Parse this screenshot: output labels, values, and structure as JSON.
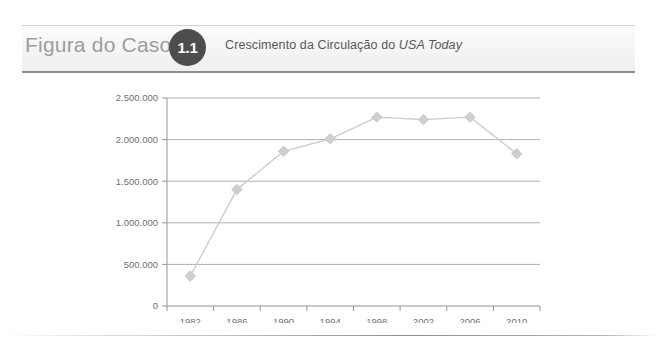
{
  "header": {
    "figure_label": "Figura do Caso",
    "figure_number": "1.1",
    "caption_prefix": "Crescimento da Circulação do ",
    "caption_emphasis": "USA Today",
    "badge_color": "#4d4d4d",
    "label_color": "#9d9d9d",
    "caption_color": "#55595c"
  },
  "chart_data": {
    "type": "line",
    "title": "Crescimento da Circulação do USA Today",
    "xlabel": "",
    "ylabel": "",
    "categories": [
      "1982",
      "1986",
      "1990",
      "1994",
      "1998",
      "2002",
      "2006",
      "2010"
    ],
    "values": [
      360000,
      1400000,
      1860000,
      2010000,
      2270000,
      2240000,
      2270000,
      1830000
    ],
    "series": [
      {
        "name": "Circulação",
        "values": [
          360000,
          1400000,
          1860000,
          2010000,
          2270000,
          2240000,
          2270000,
          1830000
        ]
      }
    ],
    "ylim": [
      0,
      2500000
    ],
    "ytick_values": [
      0,
      500000,
      1000000,
      1500000,
      2000000,
      2500000
    ],
    "ytick_labels": [
      "0",
      "500.000",
      "1.000.000",
      "1.500.000",
      "2.000.000",
      "2.500.000"
    ],
    "xtick_labels": [
      "1982",
      "1986",
      "1990",
      "1994",
      "1998",
      "2002",
      "2006",
      "2010"
    ],
    "grid": true,
    "legend": false,
    "legend_position": "none",
    "marker": "diamond",
    "line_color": "#cacaca",
    "marker_color": "#cfcfcf",
    "gridline_color": "#9c9c9c",
    "axis_color": "#8a8a8a",
    "tick_label_color": "#6f6f6f"
  }
}
